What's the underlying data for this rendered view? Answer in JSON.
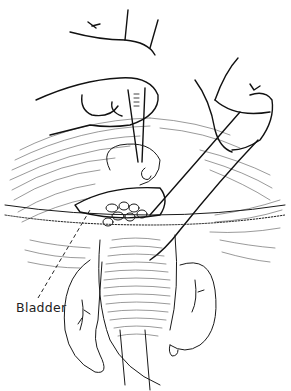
{
  "figure": {
    "kind": "surgical line illustration",
    "labels": [
      {
        "id": "bladder",
        "text": "Bladder",
        "x": 16,
        "y": 300
      }
    ],
    "ink_color": "#1a1a1a",
    "background": "#ffffff"
  }
}
